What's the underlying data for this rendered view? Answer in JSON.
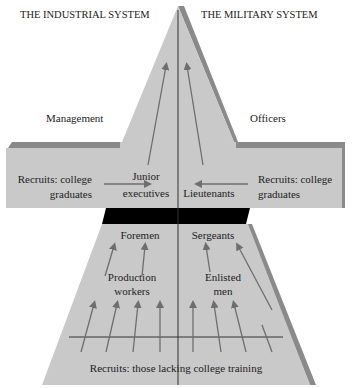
{
  "headers": {
    "left": "THE INDUSTRIAL SYSTEM",
    "right": "THE MILITARY SYSTEM"
  },
  "side_labels": {
    "left": "Management",
    "right": "Officers"
  },
  "arms": {
    "left": {
      "line1": "Recruits: college",
      "line2": "graduates"
    },
    "right": {
      "line1": "Recruits: college",
      "line2": "graduates"
    }
  },
  "mid_labels": {
    "junior1": "Junior",
    "junior2": "executives",
    "lieutenants": "Lieutenants"
  },
  "lower_labels": {
    "foremen": "Foremen",
    "sergeants": "Sergeants",
    "production1": "Production",
    "production2": "workers",
    "enlisted1": "Enlisted",
    "enlisted2": "men"
  },
  "base_label": "Recruits: those lacking college training",
  "colors": {
    "fill": "#c9c9c9",
    "shadow": "#8a8a8a",
    "bar": "#000000",
    "arrow": "#6e6e6e",
    "line": "#333333"
  }
}
